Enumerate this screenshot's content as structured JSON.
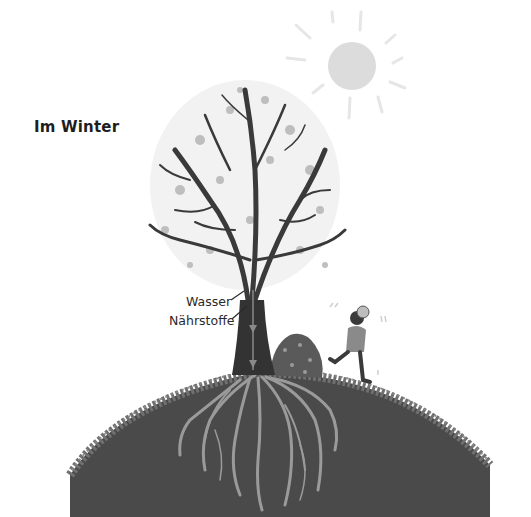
{
  "illustration": {
    "title": "Im Winter",
    "labels": {
      "water": "Wasser",
      "nutrients": "Nährstoffe"
    },
    "elements": [
      "sun-icon",
      "bare-tree",
      "roots",
      "hill",
      "child-running",
      "leaf-pile"
    ],
    "colors": {
      "background": "#ffffff",
      "soil": "#4a4a4a",
      "grass": "#6e6e6e",
      "trunk": "#333333",
      "branches": "#3a3a3a",
      "leaves": "#a9a9a9",
      "roots": "#9a9a9a",
      "sun": "#dcdcdc",
      "text": "#222222"
    }
  }
}
